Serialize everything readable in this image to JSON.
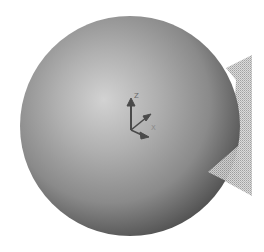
{
  "scene": {
    "background": "#ffffff",
    "sphere": {
      "cx": 130,
      "cy": 126,
      "r": 110,
      "highlight_color": "#d4d4d4",
      "mid_color": "#9a9a9a",
      "shadow_color": "#4a4a4a"
    },
    "mesh_plane": {
      "color": "#bdbdbd"
    },
    "axis_triad": {
      "color": "#4a4a4a",
      "labels": {
        "z": "Z",
        "x": "X"
      }
    }
  }
}
